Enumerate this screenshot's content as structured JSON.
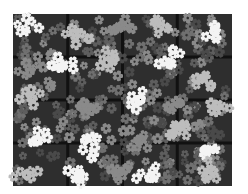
{
  "image": {
    "description": "Grayscale photo of a planting tray filled with small star-shaped flowers in white and gray clusters",
    "width": 248,
    "height": 194
  },
  "tray": {
    "x": 13,
    "y": 14,
    "width": 219,
    "height": 172,
    "fill": "#2e2e2e",
    "grid_color": "#111111",
    "cols": 4,
    "rows": 4
  },
  "palette": {
    "background": "#ffffff",
    "white_flower": "#f4f4f4",
    "light_flower": "#bdbdbd",
    "mid_flower": "#8a8a8a",
    "dark_flower": "#5e5e5e"
  },
  "clusters": [
    {
      "cx": 28,
      "cy": 30,
      "tone": "white_flower"
    },
    {
      "cx": 78,
      "cy": 33,
      "tone": "light_flower"
    },
    {
      "cx": 118,
      "cy": 28,
      "tone": "mid_flower"
    },
    {
      "cx": 158,
      "cy": 26,
      "tone": "light_flower"
    },
    {
      "cx": 214,
      "cy": 32,
      "tone": "white_flower"
    },
    {
      "cx": 30,
      "cy": 70,
      "tone": "mid_flower"
    },
    {
      "cx": 62,
      "cy": 68,
      "tone": "white_flower"
    },
    {
      "cx": 110,
      "cy": 60,
      "tone": "light_flower"
    },
    {
      "cx": 168,
      "cy": 56,
      "tone": "white_flower"
    },
    {
      "cx": 205,
      "cy": 78,
      "tone": "light_flower"
    },
    {
      "cx": 32,
      "cy": 100,
      "tone": "light_flower"
    },
    {
      "cx": 86,
      "cy": 108,
      "tone": "mid_flower"
    },
    {
      "cx": 140,
      "cy": 100,
      "tone": "white_flower"
    },
    {
      "cx": 180,
      "cy": 104,
      "tone": "mid_flower"
    },
    {
      "cx": 218,
      "cy": 108,
      "tone": "light_flower"
    },
    {
      "cx": 40,
      "cy": 140,
      "tone": "white_flower"
    },
    {
      "cx": 92,
      "cy": 146,
      "tone": "white_flower"
    },
    {
      "cx": 140,
      "cy": 140,
      "tone": "mid_flower"
    },
    {
      "cx": 176,
      "cy": 130,
      "tone": "light_flower"
    },
    {
      "cx": 206,
      "cy": 150,
      "tone": "white_flower"
    },
    {
      "cx": 26,
      "cy": 174,
      "tone": "light_flower"
    },
    {
      "cx": 78,
      "cy": 176,
      "tone": "white_flower"
    },
    {
      "cx": 118,
      "cy": 172,
      "tone": "mid_flower"
    },
    {
      "cx": 150,
      "cy": 176,
      "tone": "white_flower"
    },
    {
      "cx": 210,
      "cy": 172,
      "tone": "light_flower"
    }
  ]
}
